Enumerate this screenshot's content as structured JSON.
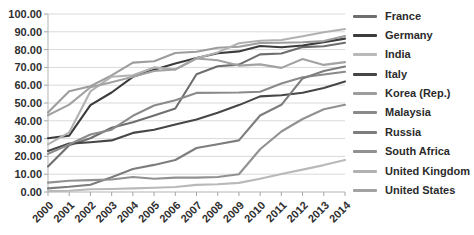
{
  "chart_data": {
    "type": "line",
    "title": "",
    "xlabel": "",
    "ylabel": "",
    "grid": true,
    "legend_position": "right",
    "x_categories": [
      "2000",
      "2001",
      "2002",
      "2003",
      "2004",
      "2005",
      "2006",
      "2007",
      "2008",
      "2009",
      "2010",
      "2011",
      "2012",
      "2013",
      "2014"
    ],
    "y_axis": {
      "min": 0,
      "max": 100,
      "step": 10,
      "tick_labels": [
        "0.00",
        "10.00",
        "20.00",
        "30.00",
        "40.00",
        "50.00",
        "60.00",
        "70.00",
        "80.00",
        "90.00",
        "100.00"
      ]
    },
    "axis_colors": {
      "gridline": "#d9d9d9",
      "axis_line": "#b3b3b3",
      "tick": "#a6a6a6",
      "label_text": "#2f2f2f"
    },
    "series": [
      {
        "name": "France",
        "color": "#6e6e6e",
        "values": [
          14.3,
          26.3,
          30.2,
          36.1,
          39.2,
          42.9,
          46.9,
          66.1,
          70.7,
          71.6,
          77.3,
          77.8,
          81.4,
          81.9,
          83.8
        ]
      },
      {
        "name": "Germany",
        "color": "#3c3c3c",
        "values": [
          30.2,
          31.7,
          48.8,
          55.9,
          64.7,
          68.7,
          72.2,
          75.2,
          78.0,
          79.0,
          82.0,
          81.3,
          82.3,
          84.2,
          86.2
        ]
      },
      {
        "name": "India",
        "color": "#b9b9b9",
        "values": [
          0.5,
          0.7,
          1.5,
          1.7,
          2.0,
          2.4,
          2.8,
          4.0,
          4.4,
          5.1,
          7.5,
          10.1,
          12.6,
          15.1,
          18.0
        ]
      },
      {
        "name": "Italy",
        "color": "#464646",
        "values": [
          23.1,
          27.2,
          28.0,
          29.0,
          33.2,
          35.0,
          38.0,
          40.8,
          44.5,
          48.8,
          53.7,
          54.4,
          55.8,
          58.5,
          62.0
        ]
      },
      {
        "name": "Korea (Rep.)",
        "color": "#9d9d9d",
        "values": [
          44.7,
          56.6,
          59.4,
          65.5,
          72.7,
          73.5,
          78.1,
          78.8,
          81.0,
          81.6,
          83.7,
          83.8,
          84.1,
          84.8,
          87.6
        ]
      },
      {
        "name": "Malaysia",
        "color": "#8a8a8a",
        "values": [
          21.4,
          26.7,
          32.3,
          35.0,
          42.8,
          48.6,
          51.6,
          55.7,
          55.8,
          55.9,
          56.3,
          61.0,
          64.5,
          66.0,
          67.5
        ]
      },
      {
        "name": "Russia",
        "color": "#7d7d7d",
        "values": [
          2.0,
          2.9,
          4.1,
          8.3,
          12.9,
          15.2,
          18.0,
          24.7,
          26.8,
          29.0,
          43.0,
          49.0,
          63.8,
          68.0,
          70.5
        ]
      },
      {
        "name": "South Africa",
        "color": "#919191",
        "values": [
          5.3,
          6.3,
          6.7,
          7.0,
          8.4,
          7.5,
          8.1,
          8.1,
          8.4,
          10.0,
          24.0,
          34.0,
          41.0,
          46.5,
          49.0
        ]
      },
      {
        "name": "United Kingdom",
        "color": "#b1b1b1",
        "values": [
          26.8,
          33.5,
          56.5,
          64.8,
          65.6,
          70.0,
          68.8,
          75.1,
          78.4,
          83.6,
          85.0,
          85.4,
          87.5,
          89.8,
          91.6
        ]
      },
      {
        "name": "United States",
        "color": "#a2a2a2",
        "values": [
          43.1,
          49.1,
          58.8,
          61.7,
          64.8,
          68.0,
          68.9,
          75.0,
          74.0,
          71.0,
          71.7,
          69.7,
          74.7,
          71.4,
          73.0
        ]
      }
    ]
  }
}
